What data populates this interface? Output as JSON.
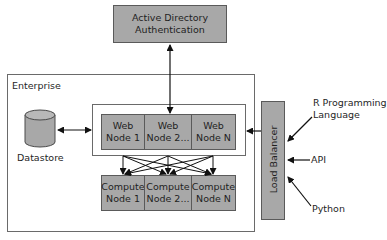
{
  "diagram": {
    "ad_auth": {
      "label": "Active Directory\nAuthentication"
    },
    "enterprise": {
      "label": "Enterprise"
    },
    "datastore": {
      "label": "Datastore",
      "icon": "database-cylinder-icon"
    },
    "web_nodes": [
      {
        "label": "Web\nNode 1"
      },
      {
        "label": "Web\nNode  2..."
      },
      {
        "label": "Web\nNode N"
      }
    ],
    "compute_nodes": [
      {
        "label": "Compute\nNode 1"
      },
      {
        "label": "Compute\nNode  2..."
      },
      {
        "label": "Compute\nNode N"
      }
    ],
    "load_balancer": {
      "label": "Load Balancer"
    },
    "clients": [
      {
        "label": "R Programming\nLanguage"
      },
      {
        "label": "API"
      },
      {
        "label": "Python"
      }
    ],
    "colors": {
      "node_fill": "#a8a8a8",
      "border": "#5a5a5a",
      "frame": "#6a6a6a",
      "arrow": "#111111"
    }
  }
}
